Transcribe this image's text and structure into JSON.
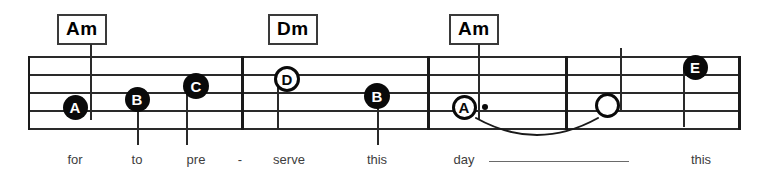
{
  "sheet": {
    "width": 783,
    "height": 180,
    "background": "#ffffff",
    "ink_color": "#1a1a1a",
    "lyric_color": "#3d3d3d"
  },
  "staff": {
    "left": 28,
    "right": 740,
    "top": 56,
    "bottom": 128,
    "line_count": 5,
    "line_spacing": 18,
    "line_ys": [
      56,
      74,
      92,
      110,
      128
    ],
    "left_edge_x": 28,
    "right_edge_x": 738
  },
  "barlines": [
    {
      "name": "barline-1",
      "x": 241
    },
    {
      "name": "barline-2",
      "x": 427
    },
    {
      "name": "barline-3",
      "x": 565
    },
    {
      "name": "barline-final",
      "x": 738
    }
  ],
  "chords": [
    {
      "label": "Am",
      "box_x": 57,
      "box_y": 14,
      "stem_x": 90,
      "stem_top": 44,
      "stem_bottom": 120
    },
    {
      "label": "Dm",
      "box_x": 268,
      "box_y": 14,
      "stem_x": 287,
      "stem_top": 44,
      "stem_bottom": 128
    },
    {
      "label": "Am",
      "box_x": 449,
      "box_y": 14,
      "stem_x": 478,
      "stem_top": 44,
      "stem_bottom": 120
    }
  ],
  "notes": [
    {
      "letter": "A",
      "style": "filled",
      "cx": 75,
      "cy": 107,
      "diameter": 25,
      "font_size": 15,
      "stem": {
        "x": 90,
        "top": 44,
        "bottom": 120
      },
      "dot": false
    },
    {
      "letter": "B",
      "style": "filled",
      "cx": 137,
      "cy": 99,
      "diameter": 25,
      "font_size": 15,
      "stem": {
        "x": 137,
        "top": 99,
        "bottom": 145
      },
      "dot": false
    },
    {
      "letter": "C",
      "style": "filled",
      "cx": 196,
      "cy": 86,
      "diameter": 26,
      "font_size": 15,
      "stem": {
        "x": 186,
        "top": 86,
        "bottom": 145
      },
      "dot": false
    },
    {
      "letter": "D",
      "style": "hollow",
      "cx": 287,
      "cy": 79,
      "diameter": 26,
      "font_size": 15,
      "stem": {
        "x": 277,
        "top": 79,
        "bottom": 128
      },
      "dot": false
    },
    {
      "letter": "B",
      "style": "filled",
      "cx": 377,
      "cy": 96,
      "diameter": 26,
      "font_size": 15,
      "stem": {
        "x": 377,
        "top": 96,
        "bottom": 145
      },
      "dot": false
    },
    {
      "letter": "A",
      "style": "hollow",
      "cx": 464,
      "cy": 107,
      "diameter": 25,
      "font_size": 15,
      "stem": {
        "x": 478,
        "top": 44,
        "bottom": 120
      },
      "dot": true,
      "dot_x": 482,
      "dot_y": 104
    },
    {
      "letter": "",
      "style": "hollow",
      "cx": 607,
      "cy": 105,
      "diameter": 25,
      "font_size": 15,
      "stem": {
        "x": 620,
        "top": 48,
        "bottom": 112
      },
      "dot": false
    },
    {
      "letter": "E",
      "style": "filled",
      "cx": 695,
      "cy": 67,
      "diameter": 25,
      "font_size": 15,
      "stem": {
        "x": 683,
        "top": 67,
        "bottom": 127
      },
      "dot": false
    }
  ],
  "tie": {
    "name": "tie-a-to-open",
    "start_x": 476,
    "end_x": 598,
    "y": 118,
    "depth": 17
  },
  "lyrics": [
    {
      "text": "for",
      "x": 75,
      "y": 152
    },
    {
      "text": "to",
      "x": 137,
      "y": 152
    },
    {
      "text": "pre",
      "x": 196,
      "y": 152
    },
    {
      "text": "-",
      "x": 240,
      "y": 152
    },
    {
      "text": "serve",
      "x": 289,
      "y": 152
    },
    {
      "text": "this",
      "x": 377,
      "y": 152
    },
    {
      "text": "day",
      "x": 464,
      "y": 152
    },
    {
      "text": "this",
      "x": 701,
      "y": 152
    }
  ],
  "lyric_extender": {
    "name": "lyric-extender-day",
    "x": 489,
    "y": 161,
    "width": 140
  }
}
